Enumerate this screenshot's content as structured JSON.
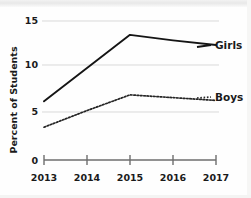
{
  "chart_data": {
    "type": "line",
    "title": "",
    "xlabel": "",
    "ylabel": "Percent of Students",
    "x": [
      "2013",
      "2014",
      "2015",
      "2016",
      "2017"
    ],
    "categories": [
      "2013",
      "2014",
      "2015",
      "2016",
      "2017"
    ],
    "series": [
      {
        "name": "Girls",
        "style": "solid",
        "values": [
          6.3,
          9.9,
          13.5,
          12.9,
          12.4
        ]
      },
      {
        "name": "Boys",
        "style": "dotted",
        "values": [
          3.5,
          5.3,
          7.0,
          6.7,
          6.4
        ]
      }
    ],
    "ylim": [
      0,
      15
    ],
    "yticks": [
      "0",
      "5",
      "10",
      "15"
    ],
    "ytick_values": [
      0,
      5,
      10,
      15
    ],
    "xticks": [
      "2013",
      "2014",
      "2015",
      "2016",
      "2017"
    ],
    "grid": true,
    "legend_position": "right-inline",
    "colors": {
      "girls_line": "#151515",
      "boys_line": "#252525",
      "gridline": "#d9d9d9",
      "axis": "#6e6e6e",
      "background": "#fefefe",
      "text": "#1a1a1a"
    }
  },
  "axes": {
    "y_title": "Percent of Students",
    "y_tick_labels": [
      "15",
      "10",
      "5",
      "0"
    ],
    "x_tick_labels": [
      "2013",
      "2014",
      "2015",
      "2016",
      "2017"
    ]
  },
  "legend": {
    "girls_label": "Girls",
    "boys_label": "Boys"
  }
}
